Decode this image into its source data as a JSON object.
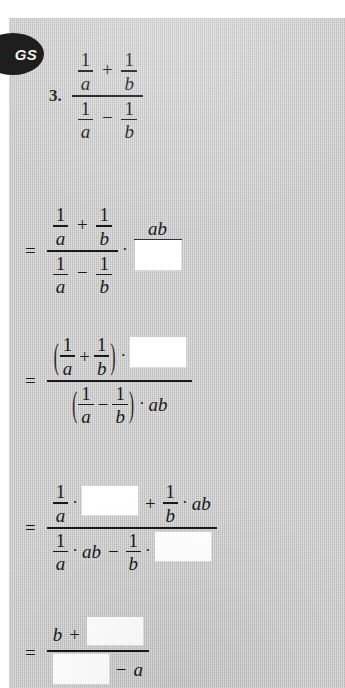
{
  "badge": {
    "label": "GS",
    "icon": "gs-badge-icon",
    "color": "#1e1e1e"
  },
  "page": {
    "background_color": "#c9c9c9",
    "text_color": "#17181a",
    "blank_color": "#ffffff"
  },
  "problem": {
    "number": "3.",
    "symbols": {
      "one": "1",
      "a": "a",
      "b": "b",
      "ab": "ab",
      "plus": "+",
      "minus": "−",
      "equals": "=",
      "dot": "·",
      "paren_open": "(",
      "paren_close": ")"
    },
    "steps": [
      {
        "id": "step-1-given",
        "equals": "",
        "description": "(1/a + 1/b) over (1/a − 1/b)",
        "numerator": "1/a + 1/b",
        "denominator": "1/a − 1/b"
      },
      {
        "id": "step-2",
        "equals": "=",
        "description": "complex fraction times ab over blank",
        "numerator": "1/a + 1/b",
        "denominator": "1/a − 1/b",
        "multiplier_numerator": "ab",
        "multiplier_denominator": ""
      },
      {
        "id": "step-3",
        "equals": "=",
        "description": "(1/a + 1/b) · blank over (1/a − 1/b) · ab",
        "numerator": "(1/a + 1/b) · ",
        "denominator": "(1/a − 1/b) · ab"
      },
      {
        "id": "step-4",
        "equals": "=",
        "description": "1/a · blank + 1/b · ab over 1/a · ab − 1/b · blank",
        "numerator": "1/a · ▢ + 1/b · ab",
        "denominator": "1/a · ab − 1/b · ▢"
      },
      {
        "id": "step-5",
        "equals": "=",
        "description": "b + blank over blank − a",
        "numerator": "b + ▢",
        "denominator": "▢ − a"
      }
    ]
  }
}
